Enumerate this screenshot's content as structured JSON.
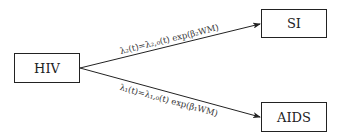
{
  "diagram": {
    "type": "state-transition",
    "nodes": [
      {
        "id": "hiv",
        "label": "HIV"
      },
      {
        "id": "si",
        "label": "SI"
      },
      {
        "id": "aids",
        "label": "AIDS"
      }
    ],
    "edges": [
      {
        "from": "hiv",
        "to": "si",
        "label": "λ₂(t)=λ₂,₀(t) exp(β₂WM)"
      },
      {
        "from": "hiv",
        "to": "aids",
        "label": "λ₁(t)=λ₁,₀(t) exp(β₁WM)"
      }
    ],
    "colors": {
      "stroke": "#222222",
      "text": "#333333",
      "background": "#ffffff"
    }
  }
}
